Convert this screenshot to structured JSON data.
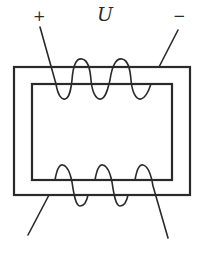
{
  "diagram": {
    "type": "transformer-core-with-two-windings",
    "labels": {
      "voltage": "U",
      "positive": "+",
      "negative": "−"
    },
    "core": {
      "outer": {
        "x": 14,
        "y": 67,
        "width": 176,
        "height": 128
      },
      "inner": {
        "x": 32,
        "y": 84,
        "width": 140,
        "height": 96
      }
    },
    "windings": [
      {
        "name": "primary",
        "position": "top",
        "turns": 3,
        "terminals": [
          "+",
          "−"
        ]
      },
      {
        "name": "secondary",
        "position": "bottom",
        "turns": 3,
        "terminals": []
      }
    ],
    "colors": {
      "line": "#2a2a2a",
      "background": "#ffffff"
    }
  }
}
